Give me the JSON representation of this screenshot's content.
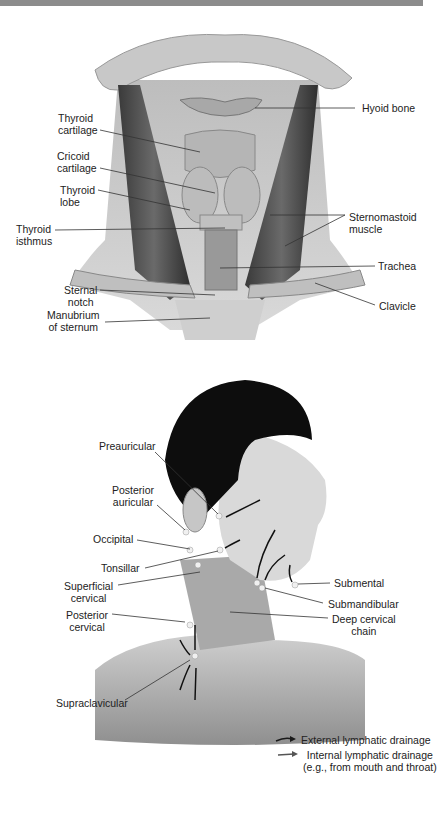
{
  "figure_top": {
    "title": "Anterior neck anatomy",
    "labels": {
      "hyoid_bone": "Hyoid bone",
      "thyroid_cartilage": "Thyroid\ncartilage",
      "cricoid_cartilage": "Cricoid\ncartilage",
      "thyroid_lobe": "Thyroid\nlobe",
      "thyroid_isthmus": "Thyroid\nisthmus",
      "sternomastoid_muscle": "Sternomastoid\nmuscle",
      "trachea": "Trachea",
      "sternal_notch": "Sternal\nnotch",
      "clavicle": "Clavicle",
      "manubrium": "Manubrium\nof sternum"
    }
  },
  "figure_bottom": {
    "title": "Lymph nodes of the head and neck",
    "labels": {
      "preauricular": "Preauricular",
      "posterior_auricular": "Posterior\nauricular",
      "occipital": "Occipital",
      "tonsillar": "Tonsillar",
      "superficial_cervical": "Superficial\ncervical",
      "posterior_cervical": "Posterior\ncervical",
      "supraclavicular": "Supraclavicular",
      "submental": "Submental",
      "submandibular": "Submandibular",
      "deep_cervical_chain": "Deep cervical\nchain"
    },
    "legend": [
      {
        "icon": "black-arrow-icon",
        "label": "External lymphatic drainage",
        "color": "#1a1a1a"
      },
      {
        "icon": "gray-arrow-icon",
        "label": "Internal lymphatic drainage\n(e.g., from mouth and throat)",
        "color": "#555555"
      }
    ]
  }
}
